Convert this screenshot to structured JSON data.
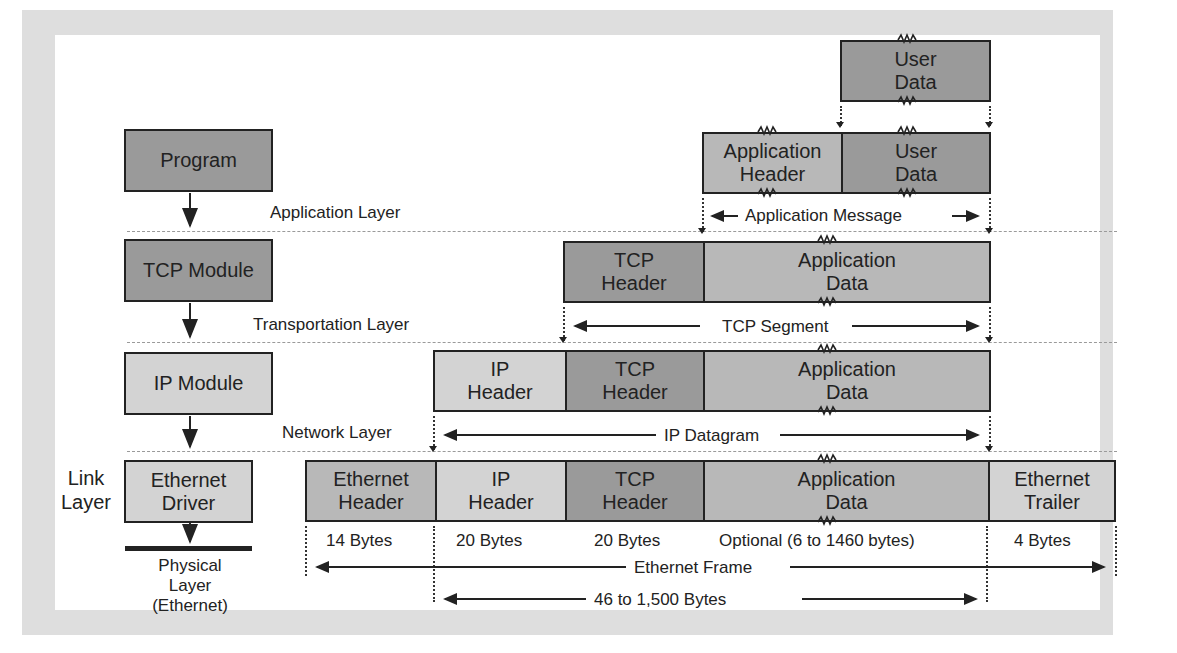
{
  "diagram": {
    "type": "tcp-ip-encapsulation",
    "left_stack": {
      "modules": [
        {
          "label": "Program",
          "shade": "dark"
        },
        {
          "label": "TCP Module",
          "shade": "dark"
        },
        {
          "label": "IP Module",
          "shade": "light"
        },
        {
          "label": "Ethernet Driver",
          "shade": "light"
        }
      ],
      "physical_layer": "Physical Layer (Ethernet)",
      "link_layer_label": "Link Layer"
    },
    "layer_labels": {
      "application": "Application Layer",
      "transport": "Transportation Layer",
      "network": "Network Layer"
    },
    "rows": {
      "user_data": [
        {
          "label": "User Data"
        }
      ],
      "application": [
        {
          "label": "Application Header"
        },
        {
          "label": "User Data"
        }
      ],
      "application_span": "Application Message",
      "tcp": [
        {
          "label": "TCP Header"
        },
        {
          "label": "Application Data"
        }
      ],
      "tcp_span": "TCP Segment",
      "ip": [
        {
          "label": "IP Header"
        },
        {
          "label": "TCP Header"
        },
        {
          "label": "Application Data"
        }
      ],
      "ip_span": "IP Datagram",
      "ethernet": [
        {
          "label": "Ethernet Header",
          "size": "14 Bytes"
        },
        {
          "label": "IP Header",
          "size": "20 Bytes"
        },
        {
          "label": "TCP Header",
          "size": "20 Bytes"
        },
        {
          "label": "Application Data",
          "size": "Optional (6 to 1460 bytes)"
        },
        {
          "label": "Ethernet Trailer",
          "size": "4 Bytes"
        }
      ],
      "ethernet_span": "Ethernet Frame",
      "payload_span": "46 to 1,500 Bytes"
    },
    "colors": {
      "dark_fill": "#9a9a9a",
      "mid_fill": "#b8b8b8",
      "light_fill": "#d3d3d3",
      "frame": "#dedede",
      "stroke": "#222222"
    }
  }
}
